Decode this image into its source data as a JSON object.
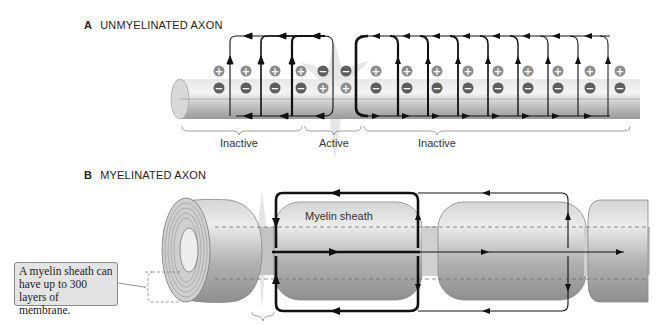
{
  "panel_a": {
    "letter": "A",
    "title": "UNMYELINATED AXON",
    "regions": [
      {
        "label": "Inactive"
      },
      {
        "label": "Active"
      },
      {
        "label": "Inactive"
      }
    ],
    "charges_top": [
      "+",
      "+",
      "+",
      "+",
      "−",
      "−",
      "+",
      "+",
      "+",
      "+",
      "+",
      "+",
      "+",
      "+",
      "+"
    ],
    "charges_bottom": [
      "−",
      "−",
      "−",
      "−",
      "+",
      "+",
      "−",
      "−",
      "−",
      "−",
      "−",
      "−",
      "−",
      "−",
      "−"
    ]
  },
  "panel_b": {
    "letter": "B",
    "title": "MYELINATED AXON",
    "sheath_label": "Myelin sheath",
    "callout": "A myelin sheath can have up to 300 layers of membrane."
  },
  "colors": {
    "axon": "#c9c9c9",
    "charge_fill": "#6b6b6b",
    "current_line": "#111111"
  }
}
